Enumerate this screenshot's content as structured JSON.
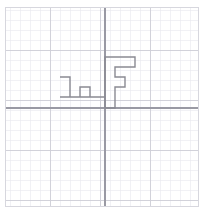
{
  "figure": {
    "kind": "graph-paper-polygon",
    "background_color": "#ffffff",
    "width": 205,
    "height": 212
  },
  "grid": {
    "minor_color": "#e8e8ee",
    "major_color": "#cfcfd8",
    "minor_spacing_px": 10,
    "major_spacing_px": 50,
    "minor_width_px": 0.6,
    "major_width_px": 0.9,
    "show_minor": true,
    "show_major": true
  },
  "frame": {
    "color": "#d7d7de",
    "width_px": 1,
    "x": 5,
    "y": 7,
    "w": 193,
    "h": 199
  },
  "axes": {
    "color": "#9a9aa4",
    "width_px": 1.1,
    "origin_x_px": 105,
    "origin_y_px": 108,
    "x_axis_label": "",
    "y_axis_label": "",
    "tick_labels": []
  },
  "shape": {
    "name": "f-glyph-polygon",
    "stroke_color": "#8a8a93",
    "stroke_width_px": 1.4,
    "fill": "none",
    "closed": true,
    "points_px": [
      [
        60,
        77
      ],
      [
        70,
        77
      ],
      [
        70,
        97
      ],
      [
        80,
        97
      ],
      [
        80,
        87
      ],
      [
        90,
        87
      ],
      [
        90,
        97
      ],
      [
        105,
        97
      ],
      [
        105,
        108
      ],
      [
        115,
        108
      ],
      [
        115,
        87
      ],
      [
        125,
        87
      ],
      [
        125,
        77
      ],
      [
        115,
        77
      ],
      [
        115,
        67
      ],
      [
        135,
        67
      ],
      [
        135,
        57
      ],
      [
        105,
        57
      ],
      [
        105,
        97
      ],
      [
        60,
        97
      ]
    ],
    "points_grid": [
      [
        -4.5,
        3.1
      ],
      [
        -3.5,
        3.1
      ],
      [
        -3.5,
        1.1
      ],
      [
        -2.5,
        1.1
      ],
      [
        -2.5,
        2.1
      ],
      [
        -1.5,
        2.1
      ],
      [
        -1.5,
        1.1
      ],
      [
        0.0,
        1.1
      ],
      [
        0.0,
        0.0
      ],
      [
        1.0,
        0.0
      ],
      [
        1.0,
        2.1
      ],
      [
        2.0,
        2.1
      ],
      [
        2.0,
        3.1
      ],
      [
        1.0,
        3.1
      ],
      [
        1.0,
        4.1
      ],
      [
        3.0,
        4.1
      ],
      [
        3.0,
        5.1
      ],
      [
        0.0,
        5.1
      ],
      [
        0.0,
        1.1
      ],
      [
        -4.5,
        1.1
      ]
    ]
  }
}
